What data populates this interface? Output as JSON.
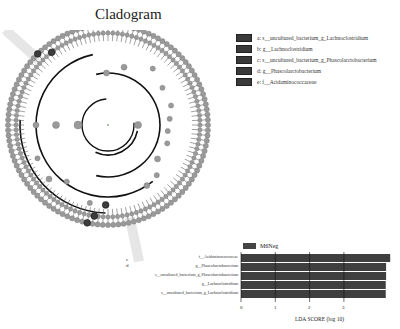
{
  "title": "Cladogram",
  "legend": [
    {
      "key": "a",
      "label": "a: s__uncultured_bacterium_g_Lachnoclostridium"
    },
    {
      "key": "b",
      "label": "b: g__Lachnoclostridium"
    },
    {
      "key": "c",
      "label": "c: s__uncultured_bacterium_g_Phascolarctobacterium"
    },
    {
      "key": "d",
      "label": "d: g__Phascolarctobacterium"
    },
    {
      "key": "e",
      "label": "e: f__Acidaminococcaceae"
    }
  ],
  "cladogram_labels": {
    "a": "a",
    "b": "b",
    "c": "c",
    "d": "d",
    "e": "e"
  },
  "colors": {
    "node": "#9a9a9a",
    "highlight": "#3c3c3c",
    "branch": "#111111",
    "bar": "#3f3f3f",
    "shade": "#e6e6e6"
  },
  "chart_data": [
    {
      "type": "cladogram",
      "title": "Cladogram",
      "legend": [
        "a: s__uncultured_bacterium_g_Lachnoclostridium",
        "b: g__Lachnoclostridium",
        "c: s__uncultured_bacterium_g_Phascolarctobacterium",
        "d: g__Phascolarctobacterium",
        "e: f__Acidaminococcaceae"
      ],
      "highlighted_clades": [
        "a",
        "b",
        "c",
        "d",
        "e"
      ]
    },
    {
      "type": "bar",
      "orientation": "horizontal",
      "categories": [
        "f__Acidaminococcaceae",
        "g__Phascolarctobacterium",
        "s__uncultured_bacterium_g_Phascolarctobacterium",
        "g__Lachnoclostridium",
        "s__uncultured_bacterium_g_Lachnoclostridium"
      ],
      "series": [
        {
          "name": "M6Neg",
          "values": [
            4.35,
            4.23,
            4.23,
            4.22,
            4.22
          ]
        }
      ],
      "xlabel": "LDA SCORE (log 10)",
      "xticks": [
        "0",
        "1",
        "2",
        "3"
      ],
      "xlim": [
        0,
        4.4
      ],
      "grid": true,
      "legend_position": "top-left"
    }
  ],
  "bar_legend": "M6Neg",
  "bar_labels": [
    "f__Acidaminococcaceae",
    "g__Phascolarctobacterium",
    "s__uncultured_bacterium_g_Phascolarctobacterium",
    "g__Lachnoclostridium",
    "s__uncultured_bacterium_g_Lachnoclostridium"
  ],
  "xticks": [
    "0",
    "1",
    "2",
    "3"
  ],
  "xlabel": "LDA SCORE (log 10)"
}
